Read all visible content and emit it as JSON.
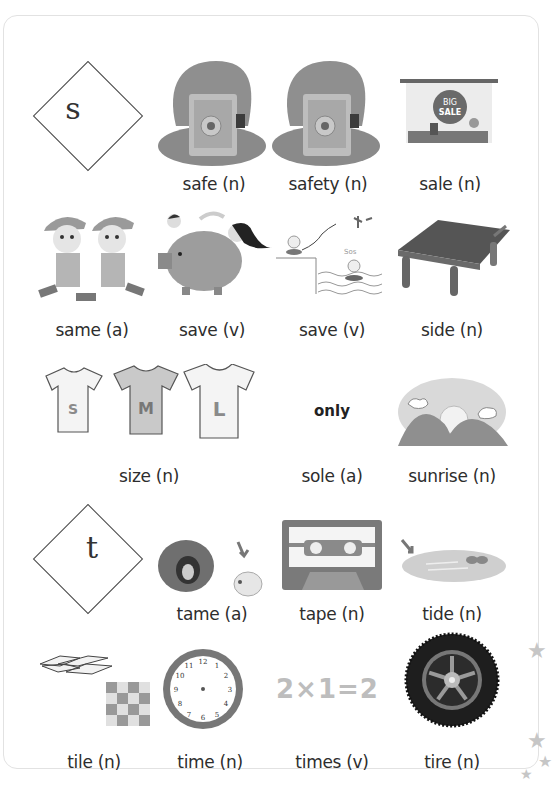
{
  "sections": [
    {
      "letter": "s"
    },
    {
      "letter": "t"
    }
  ],
  "words": [
    {
      "word": "safe",
      "pos": "(n)",
      "label": "safe (n)",
      "icon": "safe-icon"
    },
    {
      "word": "safety",
      "pos": "(n)",
      "label": "safety (n)",
      "icon": "safe-icon"
    },
    {
      "word": "sale",
      "pos": "(n)",
      "label": "sale (n)",
      "icon": "big-sale-sign-icon",
      "sign_line1": "BIG",
      "sign_line2": "SALE"
    },
    {
      "word": "same",
      "pos": "(a)",
      "label": "same (a)",
      "icon": "twin-boys-icon"
    },
    {
      "word": "save",
      "pos": "(v)",
      "label": "save (v)",
      "icon": "piggy-bank-icon"
    },
    {
      "word": "save",
      "pos": "(v)",
      "label": "save (v)",
      "icon": "rescue-sos-icon",
      "sos_text": "Sos"
    },
    {
      "word": "side",
      "pos": "(n)",
      "label": "side (n)",
      "icon": "table-icon"
    },
    {
      "word": "size",
      "pos": "(n)",
      "label": "size (n)",
      "icon": "tshirt-sizes-icon",
      "sizes": [
        "S",
        "M",
        "L"
      ]
    },
    {
      "word": "sole",
      "pos": "(a)",
      "label": "sole (a)",
      "hint": "only"
    },
    {
      "word": "sunrise",
      "pos": "(n)",
      "label": "sunrise (n)",
      "icon": "sunrise-icon"
    },
    {
      "word": "tame",
      "pos": "(a)",
      "label": "tame (a)",
      "icon": "lion-to-sheep-icon"
    },
    {
      "word": "tape",
      "pos": "(n)",
      "label": "tape (n)",
      "icon": "cassette-tape-icon"
    },
    {
      "word": "tide",
      "pos": "(n)",
      "label": "tide (n)",
      "icon": "tide-pool-icon"
    },
    {
      "word": "tile",
      "pos": "(n)",
      "label": "tile (n)",
      "icon": "tiles-icon"
    },
    {
      "word": "time",
      "pos": "(n)",
      "label": "time (n)",
      "icon": "clock-icon",
      "clock_numbers": [
        "12",
        "1",
        "2",
        "3",
        "4",
        "5",
        "6",
        "7",
        "8",
        "9",
        "10",
        "11"
      ]
    },
    {
      "word": "times",
      "pos": "(v)",
      "label": "times (v)",
      "equation": "2×1=2"
    },
    {
      "word": "tire",
      "pos": "(n)",
      "label": "tire (n)",
      "icon": "tire-icon"
    }
  ],
  "colors": {
    "ink": "#2d2d2d",
    "gray_art": "#8f8f8f",
    "card_border": "#e2e2e2",
    "star": "#c6c6c6"
  }
}
